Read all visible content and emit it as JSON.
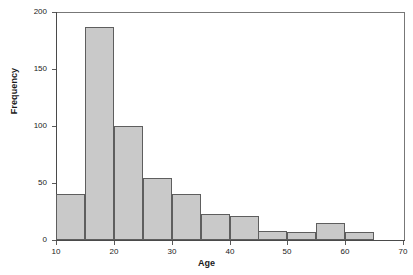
{
  "chart_data": {
    "type": "bar",
    "chart_subtype": "histogram",
    "title": "",
    "xlabel": "Age",
    "ylabel": "Frequency",
    "xlim": [
      10,
      70
    ],
    "ylim": [
      0,
      200
    ],
    "bin_width": 5,
    "grid": false,
    "legend": "none",
    "bar_fill_color": "#c9c9c9",
    "bar_edge_color": "#5e5e5e",
    "axis_color": "#4a4a4a",
    "text_color": "#1a1a1a",
    "background_color": "#ffffff",
    "xticks": [
      10,
      20,
      30,
      40,
      50,
      60,
      70
    ],
    "xtick_labels": [
      "10",
      "20",
      "30",
      "40",
      "50",
      "60",
      "70"
    ],
    "yticks": [
      0,
      50,
      100,
      150,
      200
    ],
    "ytick_labels": [
      "0",
      "50",
      "100",
      "150",
      "200"
    ],
    "bin_edges": [
      10,
      15,
      20,
      25,
      30,
      35,
      40,
      45,
      50,
      55,
      60,
      65
    ],
    "categories": [
      "10-15",
      "15-20",
      "20-25",
      "25-30",
      "30-35",
      "35-40",
      "40-45",
      "45-50",
      "50-55",
      "55-60",
      "60-65"
    ],
    "values": [
      40,
      187,
      100,
      54,
      40,
      23,
      21,
      8,
      7,
      15,
      7
    ]
  },
  "axes": {
    "x_title": "Age",
    "y_title": "Frequency"
  }
}
